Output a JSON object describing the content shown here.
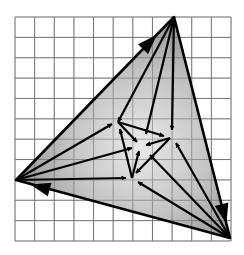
{
  "diagram": {
    "description": "Vector diagram on a square grid: an outer shaded triangle with an inner triangle, arrows radiating from outer vertices to inner vertices and center",
    "grid": {
      "x0": 15,
      "y0": 17,
      "x1": 231,
      "y1": 241,
      "cols": 11,
      "rows": 11,
      "line_color": "#9a9a9a",
      "background": "#ffffff"
    },
    "colors": {
      "stroke": "#000000",
      "fill_dark": "#8c8c8c",
      "fill_light": "#e4e4e4"
    },
    "outer_triangle": {
      "T": [
        174,
        17
      ],
      "L": [
        16,
        180
      ],
      "R": [
        230,
        238
      ]
    },
    "inner_triangle": {
      "A": [
        118,
        122
      ],
      "B": [
        170,
        138
      ],
      "C": [
        132,
        178
      ]
    },
    "center": [
      141,
      146
    ],
    "big_arrows": [
      {
        "name": "edge-L-T",
        "from": [
          16,
          180
        ],
        "to": [
          174,
          17
        ],
        "head_at": [
          150,
          42
        ]
      },
      {
        "name": "edge-T-R",
        "from": [
          174,
          17
        ],
        "to": [
          230,
          238
        ],
        "head_at": [
          224,
          214
        ]
      },
      {
        "name": "edge-R-L",
        "from": [
          230,
          238
        ],
        "to": [
          16,
          180
        ],
        "head_at": [
          40,
          187
        ]
      }
    ],
    "arrows": [
      {
        "name": "T-to-A",
        "from": [
          174,
          17
        ],
        "to": [
          118,
          122
        ]
      },
      {
        "name": "T-to-center",
        "from": [
          174,
          17
        ],
        "to": [
          146,
          134
        ]
      },
      {
        "name": "T-to-B",
        "from": [
          174,
          17
        ],
        "to": [
          172,
          130
        ]
      },
      {
        "name": "L-to-A",
        "from": [
          16,
          180
        ],
        "to": [
          112,
          124
        ]
      },
      {
        "name": "L-to-center",
        "from": [
          16,
          180
        ],
        "to": [
          132,
          148
        ]
      },
      {
        "name": "L-to-C",
        "from": [
          16,
          180
        ],
        "to": [
          126,
          178
        ]
      },
      {
        "name": "R-to-B",
        "from": [
          230,
          238
        ],
        "to": [
          176,
          143
        ]
      },
      {
        "name": "R-to-center",
        "from": [
          230,
          238
        ],
        "to": [
          150,
          155
        ]
      },
      {
        "name": "R-to-C",
        "from": [
          230,
          238
        ],
        "to": [
          138,
          182
        ]
      },
      {
        "name": "A-to-B",
        "from": [
          118,
          122
        ],
        "to": [
          164,
          136
        ]
      },
      {
        "name": "B-to-C",
        "from": [
          170,
          138
        ],
        "to": [
          136,
          173
        ]
      },
      {
        "name": "C-to-A",
        "from": [
          132,
          178
        ],
        "to": [
          120,
          129
        ]
      },
      {
        "name": "A-to-center",
        "from": [
          118,
          122
        ],
        "to": [
          137,
          142
        ]
      },
      {
        "name": "B-to-center",
        "from": [
          170,
          138
        ],
        "to": [
          146,
          145
        ]
      },
      {
        "name": "C-to-center",
        "from": [
          132,
          178
        ],
        "to": [
          139,
          151
        ]
      }
    ]
  }
}
